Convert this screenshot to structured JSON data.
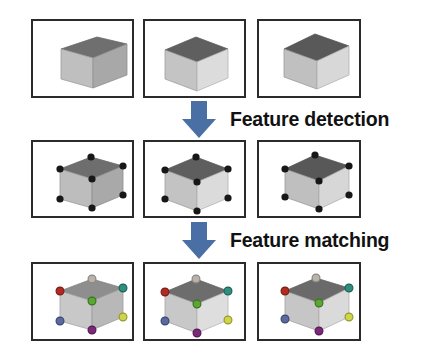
{
  "figure": {
    "background": "#ffffff",
    "width": 441,
    "height": 359
  },
  "steps": [
    {
      "id": "feature-detection",
      "label": "Feature detection",
      "arrow_color": "#4a6fa5",
      "arrow_direction": "down"
    },
    {
      "id": "feature-matching",
      "label": "Feature matching",
      "arrow_color": "#4a6fa5",
      "arrow_direction": "down"
    }
  ],
  "rows": [
    {
      "id": "row-input-images",
      "name": "input images",
      "panels": [
        {
          "id": "panel-1-1",
          "caption": "cube view 1"
        },
        {
          "id": "panel-1-2",
          "caption": "cube view 2"
        },
        {
          "id": "panel-1-3",
          "caption": "cube view 3"
        }
      ]
    },
    {
      "id": "row-detected-features",
      "name": "detected features",
      "panels": [
        {
          "id": "panel-2-1",
          "caption": "cube view 1 with detected corners"
        },
        {
          "id": "panel-2-2",
          "caption": "cube view 2 with detected corners"
        },
        {
          "id": "panel-2-3",
          "caption": "cube view 3 with detected corners"
        }
      ]
    },
    {
      "id": "row-matched-features",
      "name": "matched features",
      "panels": [
        {
          "id": "panel-3-1",
          "caption": "cube view 1 with matched corners"
        },
        {
          "id": "panel-3-2",
          "caption": "cube view 2 with matched corners"
        },
        {
          "id": "panel-3-3",
          "caption": "cube view 3 with matched corners"
        }
      ]
    }
  ],
  "cube_colors": {
    "top_face": "#6a6a6a",
    "left_face": "#c9c9c9",
    "right_face": "#adadad",
    "outline": "#7d7d7d",
    "feature_dot": "#171717"
  },
  "match_colors": [
    {
      "name": "top-back-corner",
      "hex": "#b9b3ae"
    },
    {
      "name": "top-left-corner",
      "hex": "#b02b22"
    },
    {
      "name": "top-right-corner",
      "hex": "#2e8f7f"
    },
    {
      "name": "front-top-corner",
      "hex": "#5aa832"
    },
    {
      "name": "front-left-corner",
      "hex": "#5a6a9e"
    },
    {
      "name": "front-bottom-corner",
      "hex": "#7b2a78"
    },
    {
      "name": "front-right-corner",
      "hex": "#cfd44a"
    }
  ],
  "panel_border_color": "#2b2b2b"
}
